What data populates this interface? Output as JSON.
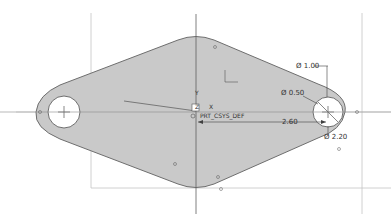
{
  "sketch": {
    "coordinate_system": {
      "name": "PRT_CSYS_DEF",
      "axis_y_label": "Y",
      "axis_x_label": "X",
      "axis_z_label": "Z"
    },
    "dimensions": [
      {
        "id": "dia-outer",
        "label": "Ø 1.00"
      },
      {
        "id": "dia-hole",
        "label": "Ø 0.50"
      },
      {
        "id": "len-center",
        "label": "2.60"
      },
      {
        "id": "dia-radius",
        "label": "Ø 2.20"
      }
    ],
    "colors": {
      "fill": "#c8c8c8",
      "outline": "#707070",
      "construction": "#b0b0b0",
      "axis": "#606060",
      "hole": "#ffffff",
      "dimension": "#404040"
    }
  }
}
